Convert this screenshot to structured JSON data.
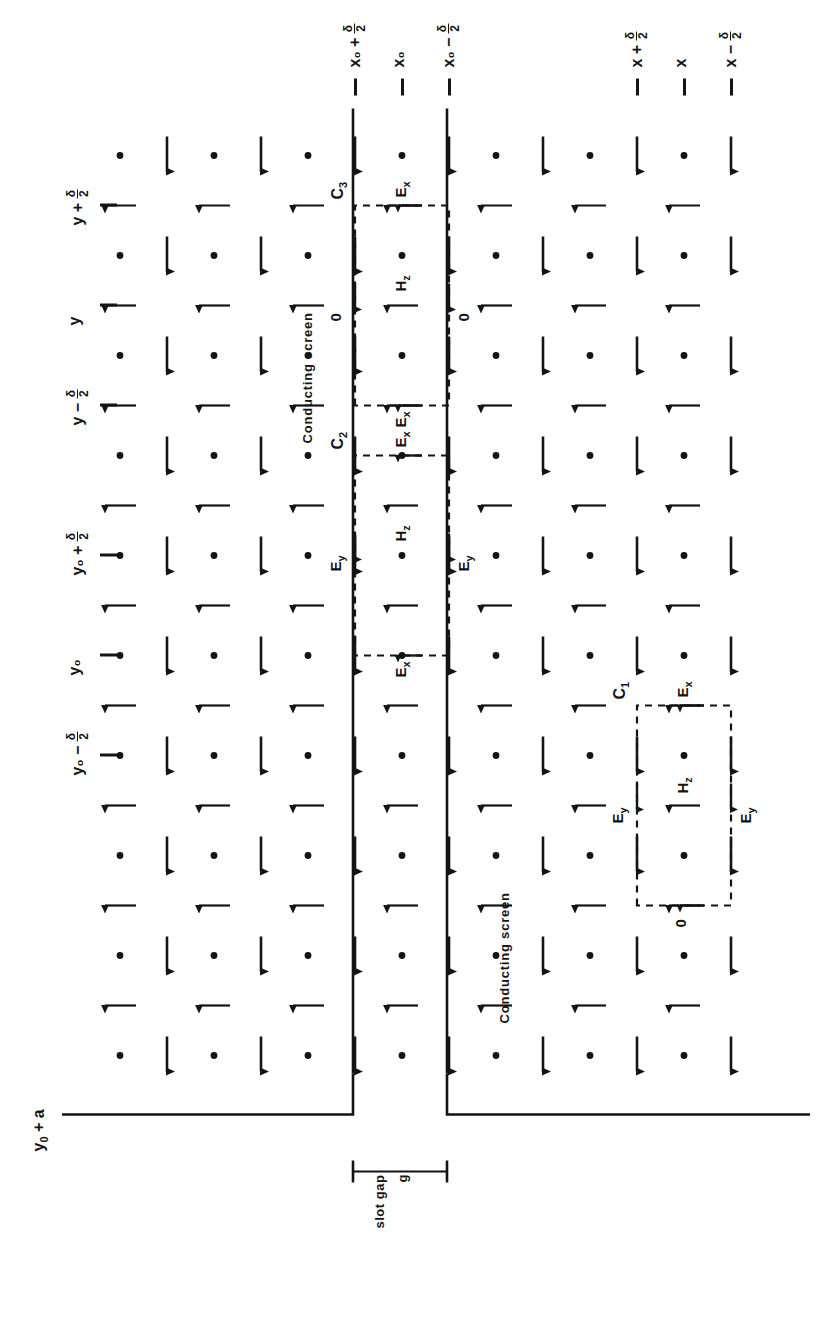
{
  "figure": {
    "kind": "technical-line-diagram",
    "orientation_note": "page is the landscape drawing rotated 90 degrees counter-clockwise"
  },
  "labels": {
    "conducting_screen": "Conducting screen",
    "slot_gap": "slot gap",
    "slot_gap_symbol": "g"
  },
  "contours": [
    {
      "id": "C1",
      "label": "C",
      "sub": "1"
    },
    {
      "id": "C2",
      "label": "C",
      "sub": "2"
    },
    {
      "id": "C3",
      "label": "C",
      "sub": "3"
    }
  ],
  "field_symbols": {
    "ex": "E",
    "ex_sub": "x",
    "ey": "E",
    "ey_sub": "y",
    "hz": "H",
    "hz_sub": "z",
    "zero": "0"
  },
  "axis_vertical": {
    "name": "y-axis ticks (drawing top edge)",
    "ticks": [
      {
        "base": "y",
        "op": "+",
        "frac_num": "δ",
        "frac_den": "2"
      },
      {
        "base": "y",
        "op": "",
        "frac_num": "",
        "frac_den": ""
      },
      {
        "base": "y",
        "op": "−",
        "frac_num": "δ",
        "frac_den": "2"
      },
      {
        "base": "y₀",
        "op": "+",
        "frac_num": "δ",
        "frac_den": "2"
      },
      {
        "base": "y₀",
        "op": "",
        "frac_num": "",
        "frac_den": ""
      },
      {
        "base": "y₀",
        "op": "−",
        "frac_num": "δ",
        "frac_den": "2"
      }
    ],
    "boundary_label": {
      "base": "y₀",
      "op": "+",
      "tail": "a"
    }
  },
  "axis_horizontal_upper": {
    "name": "x ticks near the slot (x0 family)",
    "ticks": [
      {
        "base": "x₀",
        "op": "+",
        "frac_num": "δ",
        "frac_den": "2"
      },
      {
        "base": "x₀",
        "op": "",
        "frac_num": "",
        "frac_den": ""
      },
      {
        "base": "x₀",
        "op": "−",
        "frac_num": "δ",
        "frac_den": "2"
      }
    ]
  },
  "axis_horizontal_lower": {
    "name": "x ticks at the C1 contour (x family)",
    "ticks": [
      {
        "base": "x",
        "op": "+",
        "frac_num": "δ",
        "frac_den": "2"
      },
      {
        "base": "x",
        "op": "",
        "frac_num": "",
        "frac_den": ""
      },
      {
        "base": "x",
        "op": "−",
        "frac_num": "δ",
        "frac_den": "2"
      }
    ]
  },
  "colors": {
    "ink": "#141414",
    "background": "#ffffff"
  },
  "grid": {
    "arrow_up_name": "ex-sample-arrow",
    "arrow_left_name": "ey-sample-arrow",
    "dot_name": "hz-sample-dot"
  }
}
